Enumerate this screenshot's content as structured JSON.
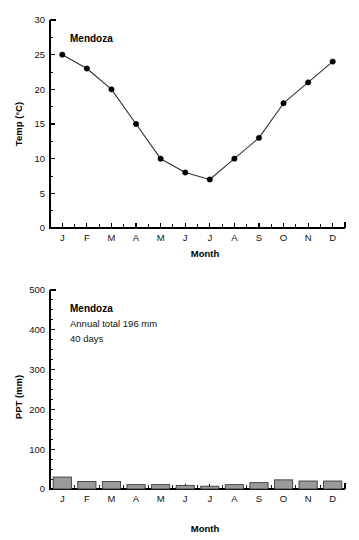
{
  "figure": {
    "station": "Mendoza"
  },
  "chart_data": [
    {
      "type": "line",
      "id": "temperature",
      "title": "Mendoza",
      "xlabel": "Month",
      "ylabel": "Temp (°C)",
      "categories": [
        "J",
        "F",
        "M",
        "A",
        "M",
        "J",
        "J",
        "A",
        "S",
        "O",
        "N",
        "D"
      ],
      "values": [
        25,
        23,
        20,
        15,
        10,
        8,
        7,
        10,
        13,
        18,
        21,
        24
      ],
      "ylim": [
        0,
        30
      ],
      "yticks": [
        0,
        5,
        10,
        15,
        20,
        25,
        30
      ],
      "ytick_labels": [
        "0",
        "5",
        "10",
        "15",
        "20",
        "25",
        "30"
      ],
      "yminor_step": 2.5,
      "grid": false,
      "legend": "none",
      "marker": "filled-circle",
      "line_color": "#303030",
      "marker_color": "#000000"
    },
    {
      "type": "bar",
      "id": "precipitation",
      "title": "Mendoza",
      "xlabel": "Month",
      "ylabel": "PPT (mm)",
      "categories": [
        "J",
        "F",
        "M",
        "A",
        "M",
        "J",
        "J",
        "A",
        "S",
        "O",
        "N",
        "D"
      ],
      "values": [
        30,
        19,
        19,
        11,
        11,
        9,
        7,
        11,
        16,
        23,
        20,
        20
      ],
      "ylim": [
        0,
        500
      ],
      "yticks": [
        0,
        100,
        200,
        300,
        400,
        500
      ],
      "ytick_labels": [
        "0",
        "100",
        "200",
        "300",
        "400",
        "500"
      ],
      "yminor_step": 25,
      "grid": false,
      "legend": "none",
      "bar_fill": "#9a9a9a",
      "bar_stroke": "#3b3b3b",
      "annotations": [
        "Mendoza",
        "Annual total 196 mm",
        "40 days"
      ],
      "annual_total_mm": 196,
      "rain_days": 40
    }
  ]
}
